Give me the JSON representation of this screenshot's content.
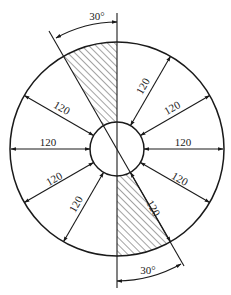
{
  "diagram": {
    "type": "annular sector layout",
    "center": {
      "x": 117,
      "y": 149
    },
    "outer_radius": 107,
    "inner_radius": 27,
    "colors": {
      "line": "#1a1a1a",
      "hatch": "#333333",
      "background": "#ffffff"
    },
    "angle_annotations": [
      {
        "label": "30°",
        "position": "top"
      },
      {
        "label": "30°",
        "position": "bottom"
      }
    ],
    "spokes": [
      {
        "angle": 0,
        "label": "120"
      },
      {
        "angle": 30,
        "label": "120"
      },
      {
        "angle": 60,
        "label": "120"
      },
      {
        "angle": 150,
        "label": "120"
      },
      {
        "angle": 180,
        "label": "120"
      },
      {
        "angle": 210,
        "label": "120"
      },
      {
        "angle": 240,
        "label": "120"
      },
      {
        "angle": -30,
        "label": "120"
      },
      {
        "angle": -60,
        "label": "120"
      }
    ],
    "hatched_sectors": [
      {
        "from": 90,
        "to": 120
      },
      {
        "from": 270,
        "to": 300
      }
    ]
  }
}
